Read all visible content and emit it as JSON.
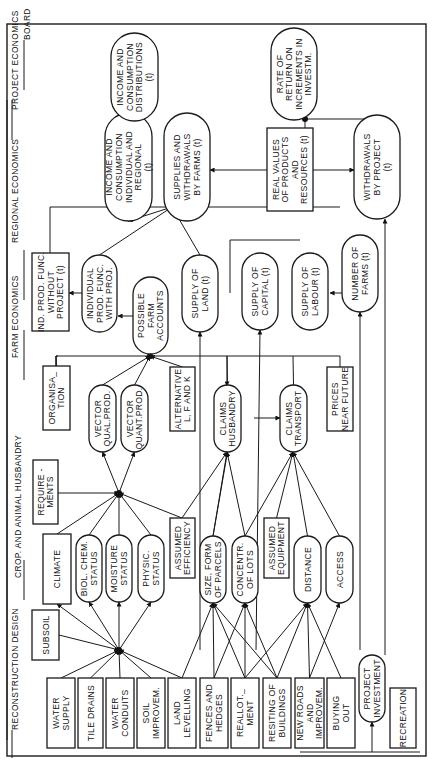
{
  "diagram": {
    "orientation": "rotated 90 degrees counter-clockwise",
    "sections": [
      {
        "id": "reconstruction-design",
        "label": "RECONSTRUCTION DESIGN"
      },
      {
        "id": "crop-animal-husbandry",
        "label": "CROP. AND ANIMAL HUSBANDRY"
      },
      {
        "id": "farm-economics",
        "label": "FARM ECONOMICS"
      },
      {
        "id": "regional-economics",
        "label": "REGIONAL ECONOMICS"
      },
      {
        "id": "project-economics",
        "label": "PROJECT ECONOMICS"
      },
      {
        "id": "board",
        "label": "BOARD"
      }
    ],
    "nodes": {
      "water_supply": {
        "lines": [
          "WATER",
          "SUPPLY"
        ],
        "shape": "rect"
      },
      "tile_drains": {
        "lines": [
          "TILE DRAINS"
        ],
        "shape": "rect"
      },
      "water_conduits": {
        "lines": [
          "WATER",
          "CONDUITS"
        ],
        "shape": "rect"
      },
      "soil_improvem": {
        "lines": [
          "SOIL",
          "IMPROVEM."
        ],
        "shape": "rect"
      },
      "land_levelling": {
        "lines": [
          "LAND",
          "LEVELLING"
        ],
        "shape": "rect"
      },
      "fences_hedges": {
        "lines": [
          "FENCES AND",
          "HEDGES"
        ],
        "shape": "rect"
      },
      "reallotment": {
        "lines": [
          "REALLOT._",
          "MENT"
        ],
        "shape": "rect"
      },
      "resiting_buildings": {
        "lines": [
          "RESITING OF",
          "BUILDINGS"
        ],
        "shape": "rect"
      },
      "new_roads": {
        "lines": [
          "NEW ROADS",
          "AND",
          "IMPROVEM."
        ],
        "shape": "rect"
      },
      "buying_out": {
        "lines": [
          "BUYING",
          "OUT"
        ],
        "shape": "rect"
      },
      "project_investment": {
        "lines": [
          "PROJECT",
          "INVESTMENT"
        ],
        "shape": "pill"
      },
      "recreation": {
        "lines": [
          "RECREATION"
        ],
        "shape": "rect"
      },
      "subsoil": {
        "lines": [
          "SUBSOIL"
        ],
        "shape": "rect"
      },
      "climate": {
        "lines": [
          "CLIMATE"
        ],
        "shape": "rect"
      },
      "biol_chem_status": {
        "lines": [
          "BIOL. CHEM.",
          "STATUS"
        ],
        "shape": "pill"
      },
      "moisture_status": {
        "lines": [
          "MOISTURE",
          "STATUS"
        ],
        "shape": "pill"
      },
      "physic_status": {
        "lines": [
          "PHYSIC.",
          "STATUS"
        ],
        "shape": "pill"
      },
      "assumed_efficiency": {
        "lines": [
          "ASSUMED",
          "EFFICIENCY"
        ],
        "shape": "rect"
      },
      "size_form_parcels": {
        "lines": [
          "SIZE, FORM",
          "OF PARCELS"
        ],
        "shape": "pill"
      },
      "concentr_lots": {
        "lines": [
          "CONCENTR.",
          "OF LOTS"
        ],
        "shape": "pill"
      },
      "assumed_equipment": {
        "lines": [
          "ASSUMED",
          "EQUIPMENT"
        ],
        "shape": "rect"
      },
      "distance": {
        "lines": [
          "DISTANCE"
        ],
        "shape": "pill"
      },
      "access": {
        "lines": [
          "ACCESS"
        ],
        "shape": "pill"
      },
      "requirements": {
        "lines": [
          "REQUIRE -",
          "MENTS"
        ],
        "shape": "rect"
      },
      "organisation": {
        "lines": [
          "ORGANISA_",
          "TION"
        ],
        "shape": "rect"
      },
      "vector_qual_prod": {
        "lines": [
          "VECTOR",
          "QUAL.PROD."
        ],
        "shape": "pill"
      },
      "vector_quant_prod": {
        "lines": [
          "VECTOR",
          "QUANT.PROD."
        ],
        "shape": "pill"
      },
      "alternative_lfk": {
        "lines": [
          "ALTERNATIVE",
          "L, F AND K"
        ],
        "shape": "rect"
      },
      "claims_husbandry": {
        "lines": [
          "CLAIMS",
          "HUSBANDRY"
        ],
        "shape": "pill"
      },
      "claims_transport": {
        "lines": [
          "CLAIMS",
          "TRANSPORT"
        ],
        "shape": "pill"
      },
      "prices_near_future": {
        "lines": [
          "PRICES",
          "NEAR FUTURE"
        ],
        "shape": "rect"
      },
      "ind_prod_without": {
        "lines": [
          "IND. PROD. FUNC.",
          "WITHOUT",
          "PROJECT (t)"
        ],
        "shape": "rect"
      },
      "ind_prod_with": {
        "lines": [
          "INDIVIDUAL",
          "PROD. FUNC.",
          "WITH PROJ."
        ],
        "shape": "pill"
      },
      "possible_farm_accounts": {
        "lines": [
          "POSSIBLE",
          "FARM",
          "ACCOUNTS"
        ],
        "shape": "pill"
      },
      "supply_land": {
        "lines": [
          "SUPPLY OF",
          "LAND (t)"
        ],
        "shape": "pill"
      },
      "supply_capital": {
        "lines": [
          "SUPPLY OF",
          "CAPITAL (t)"
        ],
        "shape": "pill"
      },
      "supply_labour": {
        "lines": [
          "SUPPLY OF",
          "LABOUR (t)"
        ],
        "shape": "pill"
      },
      "number_farms": {
        "lines": [
          "NUMBER OF",
          "FARMS (t)"
        ],
        "shape": "pill"
      },
      "income_consumption_ind_reg": {
        "lines": [
          "INCOME AND",
          "CONSUMPTION",
          "INDIVIDUAL AND",
          "REGIONAL",
          "(t)"
        ],
        "shape": "pill"
      },
      "supplies_withdrawals_farms": {
        "lines": [
          "SUPPLIES AND",
          "WITHDRAWALS",
          "BY FARMS (t)"
        ],
        "shape": "pill"
      },
      "real_values": {
        "lines": [
          "REAL VALUES",
          "OF PRODUCTS",
          "AND",
          "RESOURCES (t)"
        ],
        "shape": "rect"
      },
      "withdrawals_project": {
        "lines": [
          "WITHDRAWALS",
          "BY PROJECT",
          "(t)"
        ],
        "shape": "pill"
      },
      "income_consumption_dist": {
        "lines": [
          "INCOME AND",
          "CONSUMPTION",
          "DISTRIBUTIONS",
          "(t)"
        ],
        "shape": "pill"
      },
      "rate_of_return": {
        "lines": [
          "RATE OF",
          "RETURN ON",
          "INCREMENTS IN",
          "INVESTM."
        ],
        "shape": "pill"
      }
    }
  }
}
